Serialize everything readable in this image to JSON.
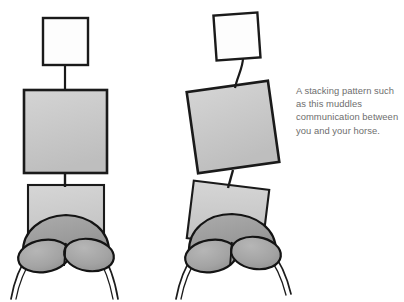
{
  "illustration": {
    "title": "Stacking pattern diagram - rider posture over horse hindquarters",
    "background_color": "#ffffff",
    "outline_color": "#1a1a1a",
    "palette": {
      "head_fill": "#fdfdfd",
      "torso_fill": "#c9c9c9",
      "hip_fill": "#cacaca",
      "croup_fill": "#9d9d9d",
      "haunch_fill": "#a3a3a3",
      "leg_stroke": "#1c1c1c"
    },
    "figures": [
      {
        "name": "aligned-rider",
        "label": "left figure",
        "head": {
          "x": 43,
          "y": 18,
          "width": 45,
          "height": 47,
          "rotation": 0
        },
        "neck": {
          "x1": 65,
          "y1": 65,
          "x2": 65,
          "y2": 90
        },
        "torso": {
          "x": 24,
          "y": 90,
          "width": 83,
          "height": 83,
          "rotation": 0
        },
        "waist": {
          "x1": 65,
          "y1": 173,
          "x2": 65,
          "y2": 185
        },
        "hip": {
          "x": 28,
          "y": 185,
          "width": 76,
          "height": 61,
          "rotation": 0
        },
        "croup_center_x": 66,
        "haunch_left_center_x": 44,
        "haunch_right_center_x": 89
      },
      {
        "name": "stacked-rider",
        "label": "right figure",
        "head": {
          "x": 215,
          "y": 14,
          "width": 44,
          "height": 45,
          "rotation": -4
        },
        "neck": {
          "x1": 242,
          "y1": 60,
          "x2": 236,
          "y2": 86
        },
        "torso": {
          "x": 192,
          "y": 86,
          "width": 82,
          "height": 82,
          "rotation": -8
        },
        "waist": {
          "x1": 232,
          "y1": 172,
          "x2": 228,
          "y2": 186
        },
        "hip": {
          "x": 190,
          "y": 185,
          "width": 76,
          "height": 58,
          "rotation": 7
        },
        "croup_center_x": 232,
        "haunch_left_center_x": 210,
        "haunch_right_center_x": 256
      }
    ]
  },
  "caption": {
    "name": "stacking-pattern-caption",
    "text": "A stacking pattern such as this muddles communication between you and your horse.",
    "color": "#6e6e6e"
  }
}
